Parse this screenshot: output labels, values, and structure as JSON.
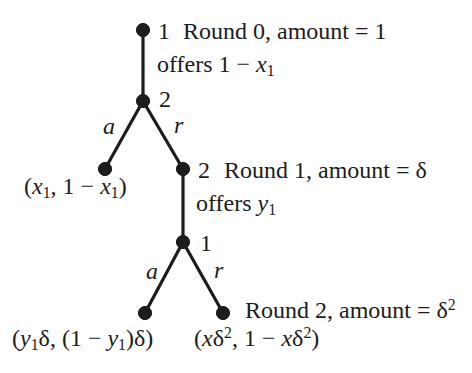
{
  "colors": {
    "ink": "#1c1c1c",
    "background": "#ffffff"
  },
  "tree": {
    "root": {
      "player": "1",
      "round_info": "Round 0, amount = 1",
      "offer": "offers 1 − *x*~1~"
    },
    "node2": {
      "player": "2"
    },
    "edges": {
      "upper_accept": "a",
      "upper_reject": "r",
      "lower_accept": "a",
      "lower_reject": "r"
    },
    "leaf_accept_round0": {
      "payoff": "(*x*~1~, 1 − *x*~1~)"
    },
    "node3": {
      "player": "2",
      "round_info": "Round 1, amount = δ",
      "offer": "offers *y*~1~"
    },
    "node4": {
      "player": "1"
    },
    "leaf_accept_round1": {
      "payoff": "(*y*~1~δ, (1 − *y*~1~)δ)"
    },
    "leaf_reject_round1": {
      "round_info": "Round 2, amount = δ^2^",
      "payoff": "(*x*δ^2^, 1 − *x*δ^2^)"
    }
  }
}
